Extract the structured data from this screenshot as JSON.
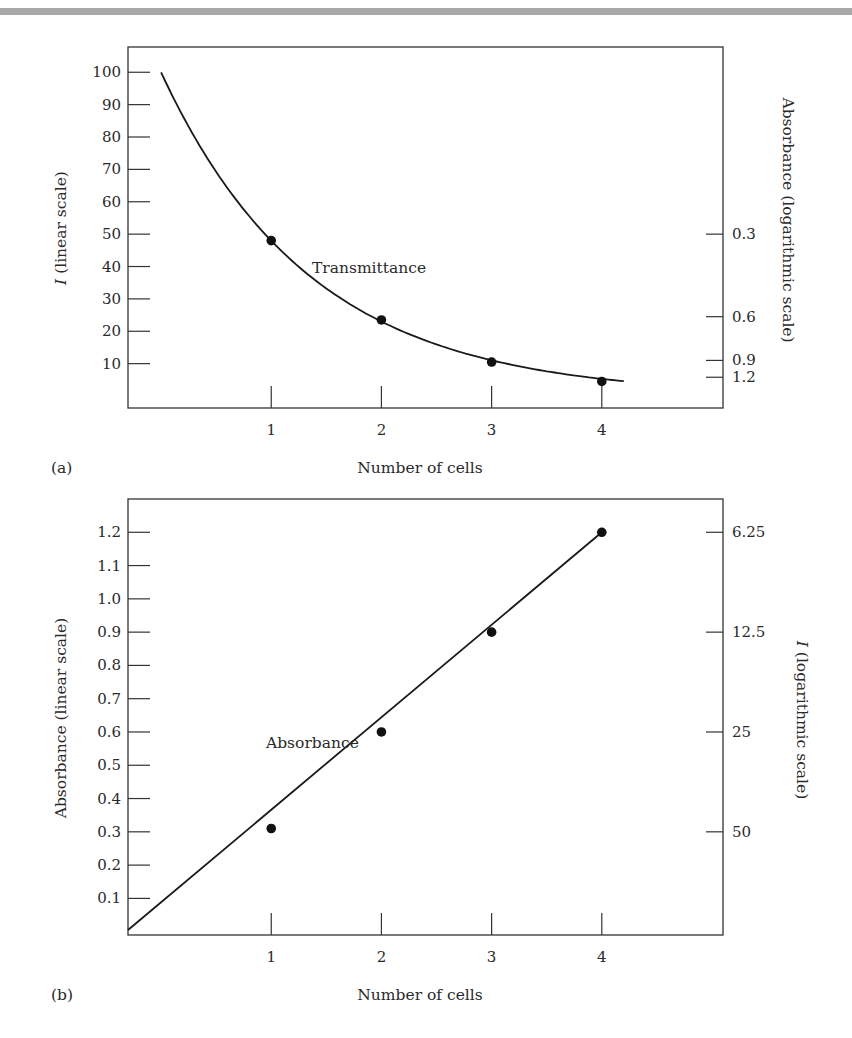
{
  "chart_data": [
    {
      "type": "line",
      "panel_label": "(a)",
      "xlabel": "Number of cells",
      "ylabel_italic": "I",
      "ylabel_rest": " (linear scale)",
      "ylabel2": "Absorbance (logarithmic scale)",
      "annotation": "Transmittance",
      "x_ticks": [
        1,
        2,
        3,
        4
      ],
      "x_tick_labels": [
        "1",
        "2",
        "3",
        "4"
      ],
      "xlim": [
        -0.3,
        5.1
      ],
      "ylim": [
        -3.7,
        107.8
      ],
      "y_ticks": [
        100,
        90,
        80,
        70,
        60,
        50,
        40,
        30,
        20,
        10
      ],
      "y_tick_labels": [
        "100",
        "90",
        "80",
        "70",
        "60",
        "50",
        "40",
        "30",
        "20",
        "10"
      ],
      "y2_ticks": [
        {
          "label": "0.3",
          "value": 50
        },
        {
          "label": "0.6",
          "value": 24.5
        },
        {
          "label": "0.9",
          "value": 11
        },
        {
          "label": "1.2",
          "value": 5.8
        }
      ],
      "curve": {
        "formula": "I = 100 * 0.5^x",
        "x_start": 0,
        "x_end": 4.2
      },
      "points": [
        {
          "x": 1,
          "y": 48
        },
        {
          "x": 2,
          "y": 23.5
        },
        {
          "x": 3,
          "y": 10.5
        },
        {
          "x": 4,
          "y": 4.5
        }
      ],
      "grid": false
    },
    {
      "type": "line",
      "panel_label": "(b)",
      "xlabel": "Number of cells",
      "ylabel": "Absorbance (linear scale)",
      "ylabel2_italic": "I",
      "ylabel2_rest": " (logarithmic scale)",
      "annotation": "Absorbance",
      "x_ticks": [
        1,
        2,
        3,
        4
      ],
      "x_tick_labels": [
        "1",
        "2",
        "3",
        "4"
      ],
      "xlim": [
        -0.3,
        5.1
      ],
      "ylim": [
        -0.01,
        1.3
      ],
      "y_ticks": [
        1.2,
        1.1,
        1.0,
        0.9,
        0.8,
        0.7,
        0.6,
        0.5,
        0.4,
        0.3,
        0.2,
        0.1
      ],
      "y_tick_labels": [
        "1.2",
        "1.1",
        "1.0",
        "0.9",
        "0.8",
        "0.7",
        "0.6",
        "0.5",
        "0.4",
        "0.3",
        "0.2",
        "0.1"
      ],
      "y2_ticks": [
        {
          "label": "6.25",
          "value": 1.2
        },
        {
          "label": "12.5",
          "value": 0.9
        },
        {
          "label": "25",
          "value": 0.6
        },
        {
          "label": "50",
          "value": 0.3
        }
      ],
      "line": {
        "x_start": -0.3,
        "y_start": 0.005,
        "x_end": 4,
        "y_end": 1.2
      },
      "points": [
        {
          "x": 1,
          "y": 0.31
        },
        {
          "x": 2,
          "y": 0.6
        },
        {
          "x": 3,
          "y": 0.9
        },
        {
          "x": 4,
          "y": 1.2
        }
      ],
      "grid": false
    }
  ]
}
